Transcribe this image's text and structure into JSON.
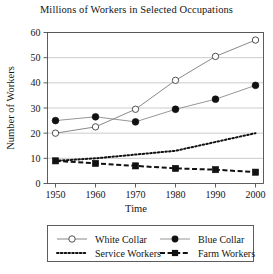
{
  "chart_data": {
    "type": "line",
    "title": "Millions of Workers in Selected Occupations",
    "xlabel": "Time",
    "ylabel": "Number of Workers",
    "categories": [
      1950,
      1960,
      1970,
      1980,
      1990,
      2000
    ],
    "xtick_labels": [
      "1950",
      "1960",
      "1970",
      "1980",
      "1990",
      "2000"
    ],
    "ytick_labels": [
      "0",
      "10",
      "20",
      "30",
      "40",
      "50",
      "60"
    ],
    "ytick_values": [
      0,
      10,
      20,
      30,
      40,
      50,
      60
    ],
    "xlim": [
      1945,
      2005
    ],
    "ylim": [
      0,
      62
    ],
    "grid": "horizontal",
    "legend_position": "bottom",
    "series": [
      {
        "name": "White Collar",
        "values": [
          20,
          22.5,
          29.5,
          41,
          50.5,
          57
        ],
        "marker": "open-circle",
        "line_style": "solid",
        "color": "#7a7a7a"
      },
      {
        "name": "Blue Collar",
        "values": [
          25,
          26.5,
          24.5,
          29.5,
          33.5,
          39
        ],
        "marker": "filled-circle",
        "line_style": "solid",
        "color": "#8a8a8a"
      },
      {
        "name": "Service Workers",
        "values": [
          9,
          10,
          11.5,
          13,
          16.5,
          20
        ],
        "marker": "none",
        "line_style": "dotted",
        "color": "#111111"
      },
      {
        "name": "Farm Workers",
        "values": [
          9,
          8,
          7,
          6,
          5.5,
          4.5
        ],
        "marker": "filled-square",
        "line_style": "dashed",
        "color": "#111111"
      }
    ]
  },
  "legend": {
    "entries": [
      {
        "label": "White Collar"
      },
      {
        "label": "Blue Collar"
      },
      {
        "label": "Service Workers"
      },
      {
        "label": "Farm Workers"
      }
    ]
  }
}
